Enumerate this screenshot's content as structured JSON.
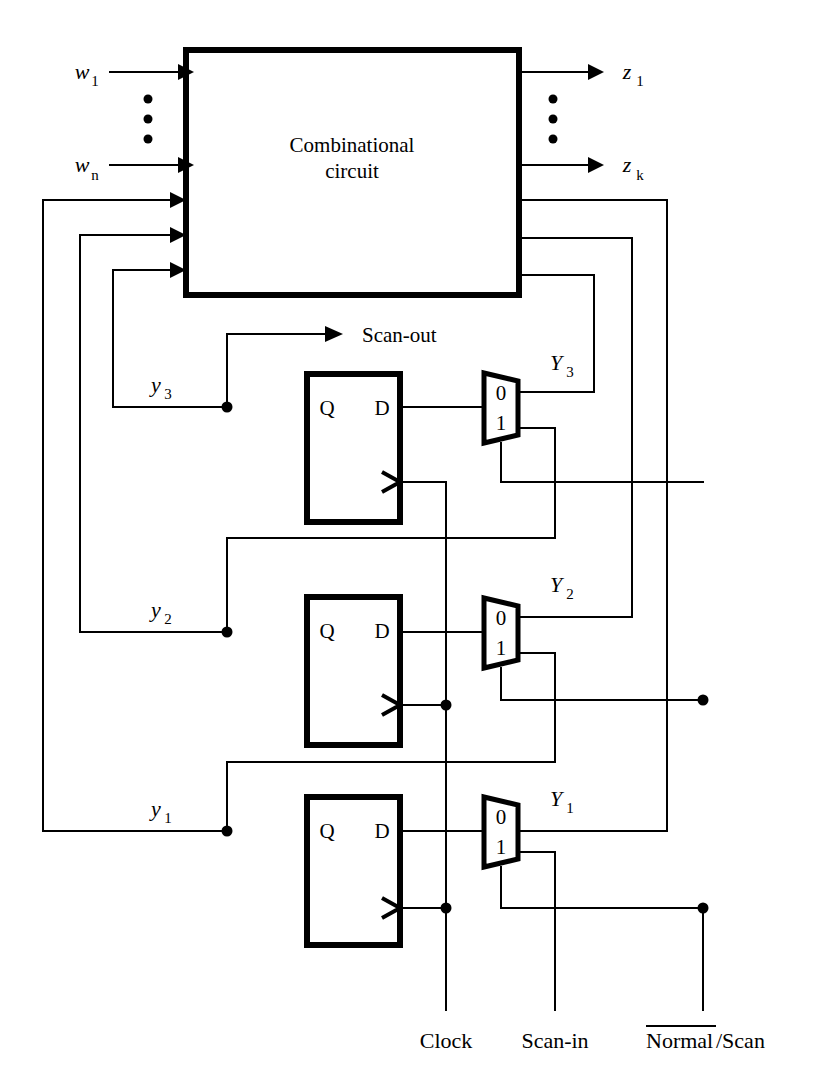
{
  "figure": {
    "block": {
      "label_line1": "Combinational",
      "label_line2": "circuit"
    },
    "inputs": {
      "w_first": "w",
      "w_first_sub": "1",
      "w_last": "w",
      "w_last_sub": "n",
      "vertical_dots": "•"
    },
    "outputs": {
      "z_first": "z",
      "z_first_sub": "1",
      "z_last": "z",
      "z_last_sub": "k"
    },
    "state_labels": [
      {
        "name": "y",
        "sub": "3"
      },
      {
        "name": "y",
        "sub": "2"
      },
      {
        "name": "y",
        "sub": "1"
      }
    ],
    "next_state_labels": [
      {
        "name": "Y",
        "sub": "3"
      },
      {
        "name": "Y",
        "sub": "2"
      },
      {
        "name": "Y",
        "sub": "1"
      }
    ],
    "flipflops": [
      {
        "q_pin": "Q",
        "d_pin": "D"
      },
      {
        "q_pin": "Q",
        "d_pin": "D"
      },
      {
        "q_pin": "Q",
        "d_pin": "D"
      }
    ],
    "muxes": [
      {
        "input_0": "0",
        "input_1": "1"
      },
      {
        "input_0": "0",
        "input_1": "1"
      },
      {
        "input_0": "0",
        "input_1": "1"
      }
    ],
    "scan_out_label": "Scan-out",
    "bottom_ports": [
      {
        "label": "Clock",
        "overbar": false
      },
      {
        "label": "Scan-in",
        "overbar": false
      },
      {
        "label_overbarred": "Normal",
        "label_rest": "/Scan",
        "overbar": true
      }
    ],
    "colors": {
      "line": "#000000",
      "background": "#ffffff"
    }
  }
}
